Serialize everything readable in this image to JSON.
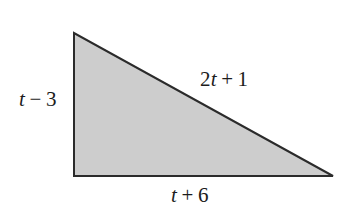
{
  "figure": {
    "kind": "right-triangle-diagram",
    "background_color": "#ffffff",
    "width": 344,
    "height": 217
  },
  "shape": {
    "name": "right-triangle",
    "fill_color": "#cdcdcd",
    "stroke_color": "#2b2b2b",
    "stroke_width": 2,
    "points": "74,33 74,176 333,176",
    "vertices": {
      "top_left": [
        74,
        33
      ],
      "bottom_left": [
        74,
        176
      ],
      "bottom_right": [
        333,
        176
      ]
    }
  },
  "labels": {
    "left_leg": {
      "text": "t − 3",
      "variable": "t",
      "operator": "−",
      "constant": "3"
    },
    "hypotenuse": {
      "text": "2t + 1",
      "coefficient": "2",
      "variable": "t",
      "operator": "+",
      "constant": "1"
    },
    "base": {
      "text": "t + 6",
      "variable": "t",
      "operator": "+",
      "constant": "6"
    }
  }
}
